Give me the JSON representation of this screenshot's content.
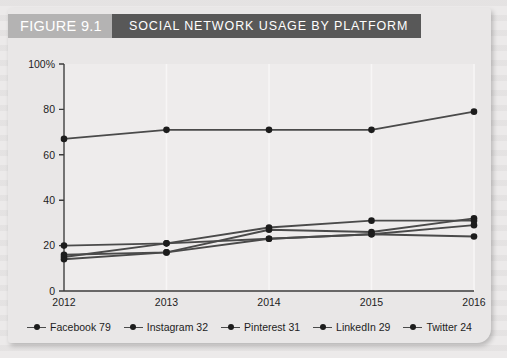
{
  "figure": {
    "number_label": "FIGURE 9.1",
    "title": "SOCIAL NETWORK USAGE BY PLATFORM"
  },
  "colors": {
    "panel_background": "#e9e7e7",
    "page_background": "#eceaea",
    "figure_number_block": "#b4b3b3",
    "title_block": "#585858",
    "line": "#4a4a4a",
    "marker": "#1c1c1c",
    "axis": "#3c3c3c",
    "gridline": "#f7f6f6"
  },
  "legend": {
    "items": [
      {
        "label": "Facebook 79",
        "marker": "line-dot-marker"
      },
      {
        "label": "Instagram 32",
        "marker": "line-dot-marker"
      },
      {
        "label": "Pinterest 31",
        "marker": "line-dot-marker"
      },
      {
        "label": "LinkedIn 29",
        "marker": "line-dot-marker"
      },
      {
        "label": "Twitter 24",
        "marker": "line-dot-marker"
      }
    ]
  },
  "chart_data": {
    "type": "line",
    "title": "SOCIAL NETWORK USAGE BY PLATFORM",
    "xlabel": "",
    "ylabel": "",
    "categories": [
      "2012",
      "2013",
      "2014",
      "2015",
      "2016"
    ],
    "x": [
      2012,
      2013,
      2014,
      2015,
      2016
    ],
    "ylim": [
      0,
      100
    ],
    "xlim": [
      2012,
      2016
    ],
    "ytick_labels": [
      "0",
      "20",
      "40",
      "60",
      "80",
      "100%"
    ],
    "yticks": [
      0,
      20,
      40,
      60,
      80,
      100
    ],
    "xtick_labels": [
      "2012",
      "2013",
      "2014",
      "2015",
      "2016"
    ],
    "grid": "vertical-only",
    "legend_position": "bottom",
    "series": [
      {
        "name": "Facebook",
        "values": [
          67,
          71,
          71,
          71,
          79
        ],
        "final_value": 79
      },
      {
        "name": "Instagram",
        "values": [
          14,
          17,
          27,
          26,
          32
        ],
        "final_value": 32
      },
      {
        "name": "Pinterest",
        "values": [
          15,
          21,
          28,
          31,
          31
        ],
        "final_value": 31
      },
      {
        "name": "LinkedIn",
        "values": [
          20,
          21,
          23,
          25,
          29
        ],
        "final_value": 29
      },
      {
        "name": "Twitter",
        "values": [
          16,
          17,
          23,
          25,
          24
        ],
        "final_value": 24
      }
    ]
  }
}
